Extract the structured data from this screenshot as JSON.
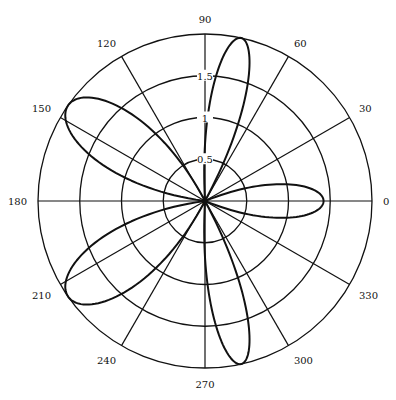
{
  "chart_data": {
    "type": "polar-line",
    "title": "",
    "center_px": [
      205,
      201
    ],
    "outer_radius_px": 167,
    "rmax": 2.0,
    "radial_ticks": [
      0.5,
      1,
      1.5,
      2
    ],
    "radial_tick_labels": [
      "0.5",
      "1",
      "1.5"
    ],
    "radial_label_angle_deg": 90,
    "center_label": "0",
    "angular_ticks_deg": [
      0,
      30,
      60,
      90,
      120,
      150,
      180,
      210,
      240,
      270,
      300,
      330
    ],
    "angular_tick_labels": [
      "0",
      "30",
      "60",
      "90",
      "120",
      "150",
      "180",
      "210",
      "240",
      "270",
      "300",
      "330"
    ],
    "grid": true,
    "series": [
      {
        "name": "pattern",
        "description": "five-lobed polar curve through origin",
        "lobes": [
          {
            "center_deg": 0,
            "peak": 1.42,
            "start_deg": -22,
            "end_deg": 22
          },
          {
            "center_deg": 77,
            "peak": 2.0,
            "start_deg": 62,
            "end_deg": 93
          },
          {
            "center_deg": 145,
            "peak": 2.0,
            "start_deg": 118,
            "end_deg": 172
          },
          {
            "center_deg": 215,
            "peak": 2.0,
            "start_deg": 188,
            "end_deg": 242
          },
          {
            "center_deg": 283,
            "peak": 2.0,
            "start_deg": 267,
            "end_deg": 298
          }
        ]
      }
    ]
  }
}
